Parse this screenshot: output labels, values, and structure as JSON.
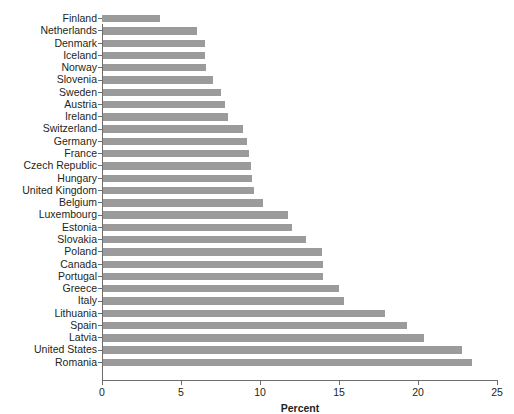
{
  "chart_data": {
    "type": "bar",
    "orientation": "horizontal",
    "title": "",
    "xlabel": "Percent",
    "ylabel": "",
    "xlim": [
      0,
      25
    ],
    "xticks": [
      0,
      5,
      10,
      15,
      20,
      25
    ],
    "grid": false,
    "legend": null,
    "bar_color": "#9b9b9b",
    "axis_color": "#6d6d6d",
    "text_color": "#231f20",
    "categories": [
      "Finland",
      "Netherlands",
      "Denmark",
      "Iceland",
      "Norway",
      "Slovenia",
      "Sweden",
      "Austria",
      "Ireland",
      "Switzerland",
      "Germany",
      "France",
      "Czech Republic",
      "Hungary",
      "United Kingdom",
      "Belgium",
      "Luxembourg",
      "Estonia",
      "Slovakia",
      "Poland",
      "Canada",
      "Portugal",
      "Greece",
      "Italy",
      "Lithuania",
      "Spain",
      "Latvia",
      "United States",
      "Romania"
    ],
    "values": [
      3.7,
      6.0,
      6.5,
      6.5,
      6.6,
      7.0,
      7.5,
      7.8,
      8.0,
      8.9,
      9.2,
      9.3,
      9.4,
      9.5,
      9.6,
      10.2,
      11.8,
      12.0,
      12.9,
      13.9,
      14.0,
      14.0,
      15.0,
      15.3,
      17.9,
      19.3,
      20.4,
      22.8,
      23.4
    ]
  }
}
